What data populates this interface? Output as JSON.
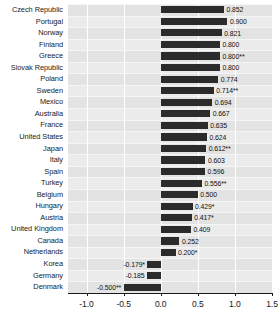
{
  "chart_data": {
    "type": "bar",
    "orientation": "horizontal",
    "title": "",
    "subtitle": "",
    "xlabel": "",
    "ylabel": "",
    "xlim": [
      -1.25,
      1.5
    ],
    "xticks": [
      -1.0,
      -0.5,
      0.0,
      0.5,
      1.0,
      1.5
    ],
    "xtick_labels": [
      "-1.0",
      "-0.5",
      "0.0",
      "0.5",
      "1.0",
      "1.5"
    ],
    "grid": true,
    "legend": null,
    "bar_color": "#2b2b2b",
    "plot_background": "#ebebeb",
    "categories": [
      "Czech Republic",
      "Portugal",
      "Norway",
      "Finland",
      "Greece",
      "Slovak Republic",
      "Poland",
      "Sweden",
      "Mexico",
      "Australia",
      "France",
      "United States",
      "Japan",
      "Italy",
      "Spain",
      "Turkey",
      "Belgium",
      "Hungary",
      "Austria",
      "United Kingdom",
      "Canada",
      "Netherlands",
      "Korea",
      "Germany",
      "Denmark"
    ],
    "values": [
      0.852,
      0.9,
      0.821,
      0.8,
      0.8,
      0.8,
      0.774,
      0.714,
      0.694,
      0.667,
      0.635,
      0.624,
      0.612,
      0.603,
      0.596,
      0.556,
      0.5,
      0.429,
      0.417,
      0.409,
      0.252,
      0.2,
      -0.179,
      -0.185,
      -0.5
    ],
    "value_labels": [
      "0.852",
      "0.900",
      "0.821",
      "0.800",
      "0.800**",
      "0.800",
      "0.774",
      "0.714**",
      "0.694",
      "0.667",
      "0.635",
      "0.624",
      "0.612**",
      "0.603",
      "0.596",
      "0.556**",
      "0.500",
      "0.429*",
      "0.417*",
      "0.409",
      "0.252",
      "0.200*",
      "-0.179*",
      "-0.185",
      "-0.500**"
    ]
  }
}
